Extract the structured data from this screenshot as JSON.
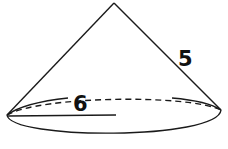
{
  "figure": {
    "type": "cone",
    "labels": {
      "slant_height": "5",
      "radius": "6"
    },
    "colors": {
      "stroke": "#1a1a1a",
      "background": "#ffffff"
    }
  }
}
